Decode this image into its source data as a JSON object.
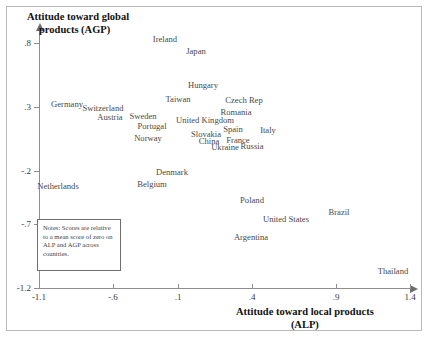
{
  "chart_data": {
    "type": "scatter",
    "title": "",
    "xlabel": "Attitude toward local products (ALP)",
    "xlabel_line1": "Attitude toward local products",
    "xlabel_line2": "(ALP)",
    "ylabel": "Attitude toward global products (AGP)",
    "ylabel_line1": "Attitude toward global",
    "ylabel_line2": "products (AGP)",
    "xlim": [
      -1.1,
      1.4
    ],
    "ylim": [
      -1.2,
      0.8
    ],
    "xticks": [
      -1.1,
      -0.6,
      0.1,
      0.4,
      0.9,
      1.4
    ],
    "xtick_labels": [
      "-1.1",
      "-.6",
      ".1",
      ".4",
      ".9",
      "1.4"
    ],
    "yticks": [
      0.8,
      0.3,
      -0.2,
      -0.7,
      -1.2
    ],
    "ytick_labels": [
      ".8",
      ".3",
      "-.2",
      "-.7",
      "-1.2"
    ],
    "grid": false,
    "legend": "none",
    "labels_as_markers": true,
    "points": [
      {
        "name": "Ireland",
        "x": 0.02,
        "y": 0.78,
        "px": 165,
        "py": 39
      },
      {
        "name": "Japan",
        "x": 0.17,
        "y": 0.71,
        "px": 196,
        "py": 51
      },
      {
        "name": "Hungary",
        "x": 0.18,
        "y": 0.42,
        "px": 203,
        "py": 85
      },
      {
        "name": "Taiwan",
        "x": 0.04,
        "y": 0.35,
        "px": 178,
        "py": 99
      },
      {
        "name": "Czech Rep",
        "x": 0.32,
        "y": 0.34,
        "px": 244,
        "py": 100
      },
      {
        "name": "Germany",
        "x": -0.79,
        "y": 0.31,
        "px": 67,
        "py": 104
      },
      {
        "name": "Switzerland",
        "x": -0.6,
        "y": 0.29,
        "px": 103,
        "py": 108
      },
      {
        "name": "Romania",
        "x": 0.3,
        "y": 0.27,
        "px": 236,
        "py": 112
      },
      {
        "name": "Austria",
        "x": -0.52,
        "y": 0.24,
        "px": 110,
        "py": 117
      },
      {
        "name": "Sweden",
        "x": -0.37,
        "y": 0.24,
        "px": 143,
        "py": 116
      },
      {
        "name": "United Kingdom",
        "x": 0.09,
        "y": 0.22,
        "px": 205,
        "py": 120
      },
      {
        "name": "Portugal",
        "x": -0.31,
        "y": 0.19,
        "px": 152,
        "py": 126
      },
      {
        "name": "Spain",
        "x": 0.26,
        "y": 0.17,
        "px": 233,
        "py": 129
      },
      {
        "name": "Italy",
        "x": 0.51,
        "y": 0.16,
        "px": 268,
        "py": 130
      },
      {
        "name": "Slovakia",
        "x": 0.15,
        "y": 0.14,
        "px": 206,
        "py": 134
      },
      {
        "name": "Norway",
        "x": -0.33,
        "y": 0.11,
        "px": 148,
        "py": 138
      },
      {
        "name": "China",
        "x": 0.17,
        "y": 0.1,
        "px": 209,
        "py": 141
      },
      {
        "name": "France",
        "x": 0.29,
        "y": 0.1,
        "px": 238,
        "py": 140
      },
      {
        "name": "Ukraine",
        "x": 0.24,
        "y": 0.06,
        "px": 225,
        "py": 147
      },
      {
        "name": "Russia",
        "x": 0.37,
        "y": 0.07,
        "px": 252,
        "py": 146
      },
      {
        "name": "Denmark",
        "x": 0.0,
        "y": -0.23,
        "px": 172,
        "py": 172
      },
      {
        "name": "Belgium",
        "x": -0.19,
        "y": -0.3,
        "px": 152,
        "py": 184
      },
      {
        "name": "Netherlands",
        "x": -0.88,
        "y": -0.32,
        "px": 58,
        "py": 186
      },
      {
        "name": "Poland",
        "x": 0.49,
        "y": -0.5,
        "px": 252,
        "py": 200
      },
      {
        "name": "Brazil",
        "x": 0.94,
        "y": -0.56,
        "px": 339,
        "py": 212
      },
      {
        "name": "United States",
        "x": 0.63,
        "y": -0.61,
        "px": 286,
        "py": 219
      },
      {
        "name": "Argentina",
        "x": 0.46,
        "y": -0.7,
        "px": 251,
        "py": 237
      },
      {
        "name": "Thailand",
        "x": 1.29,
        "y": -1.14,
        "px": 393,
        "py": 271
      }
    ],
    "notes": "Notes: Scores are relative to a mean score of zero on ALP and AGP across countries."
  },
  "axes": {
    "y_title_line1": "Attitude toward global",
    "y_title_line2": "products (AGP)",
    "x_title_line1": "Attitude toward local products",
    "x_title_line2": "(ALP)"
  },
  "notes_box": {
    "text": "Notes: Scores are relative to a mean score of zero on ALP and AGP across countries."
  },
  "colors": {
    "axis": "#8e8e8e",
    "label_text": "#4a4a4a",
    "title_text": "#111111",
    "frame": "#b9b9b9",
    "notes_border": "#6f6f6f",
    "background": "#ffffff"
  }
}
